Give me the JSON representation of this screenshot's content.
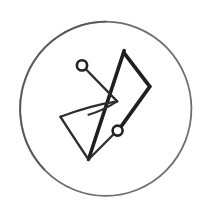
{
  "canvas": {
    "width": 210,
    "height": 217,
    "background": "#ffffff",
    "description": "hand-drawn circular emblem: abstract bowtie of two triangles with two small node circles, sketched in ink inside a thin circle outline"
  },
  "emblem": {
    "colors": {
      "outer_ring": "#6e6e6e",
      "outer_ring_dark": "#4f4f4f",
      "thick_stroke": "#1f1f1f",
      "line_stroke": "#2d2d2d",
      "node_stroke": "#222222",
      "fill": "#ffffff"
    },
    "elements": [
      {
        "name": "outer-circle",
        "type": "ellipse",
        "cx": 105.7,
        "cy": 108.8,
        "rx": 85.7,
        "ry": 87.1,
        "strokeKey": "outer_ring",
        "width": 1.8,
        "fill": "none"
      },
      {
        "name": "outer-circle-shade-arc",
        "type": "path",
        "d": "M 105.5 21.8 A 85.9 87.2 0 0 0 44.2 169.5",
        "strokeKey": "outer_ring_dark",
        "width": 2.0,
        "opacity": 0.65,
        "fill": "none"
      },
      {
        "name": "thick-long-leg",
        "type": "path",
        "d": "M 88.5 159.5 L 124.2 50.6",
        "strokeKey": "thick_stroke",
        "width": 3.6,
        "fill": "none"
      },
      {
        "name": "thick-flag-edges",
        "type": "path",
        "d": "M 123.6 52.4 L 149.8 86.5 L 121.2 126.3",
        "strokeKey": "thick_stroke",
        "width": 3.7,
        "fill": "none"
      },
      {
        "name": "node-a-line",
        "type": "path",
        "d": "M 85.9 69.3 L 117.2 101.4",
        "strokeKey": "line_stroke",
        "width": 2.3,
        "fill": "none"
      },
      {
        "name": "triangle-top-edge",
        "type": "path",
        "d": "M 60.5 116.8 Q 90 105.5 117.2 101.4",
        "strokeKey": "line_stroke",
        "width": 2.3,
        "fill": "none"
      },
      {
        "name": "triangle-jaw-stroke",
        "type": "path",
        "d": "M 117.2 101.4 Q 102 111 88.5 114.8",
        "strokeKey": "line_stroke",
        "width": 2.2,
        "fill": "none"
      },
      {
        "name": "triangle-left-edge",
        "type": "path",
        "d": "M 60.5 116.8 Q 71.5 134 88.5 159.5",
        "strokeKey": "line_stroke",
        "width": 2.4,
        "fill": "none"
      },
      {
        "name": "node-b-line",
        "type": "path",
        "d": "M 88.5 159.5 L 113.6 134.2",
        "strokeKey": "line_stroke",
        "width": 2.3,
        "fill": "none"
      },
      {
        "name": "node-a-circle",
        "type": "circle",
        "cx": 82,
        "cy": 65.4,
        "r": 5.1,
        "strokeKey": "node_stroke",
        "width": 2.6,
        "fillKey": "fill"
      },
      {
        "name": "node-b-circle",
        "type": "circle",
        "cx": 117.6,
        "cy": 130.6,
        "r": 5.0,
        "strokeKey": "node_stroke",
        "width": 2.6,
        "fillKey": "fill"
      }
    ]
  }
}
